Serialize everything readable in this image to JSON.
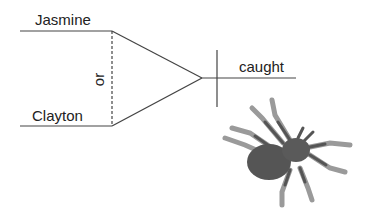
{
  "diagram": {
    "type": "sentence-diagram",
    "subjects": [
      "Jasmine",
      "Clayton"
    ],
    "conjunction": "or",
    "predicate": "caught",
    "illustration": "spider-icon"
  },
  "colors": {
    "line": "#444444",
    "spider_body": "#555555",
    "spider_leg": "#9a9a9a"
  }
}
